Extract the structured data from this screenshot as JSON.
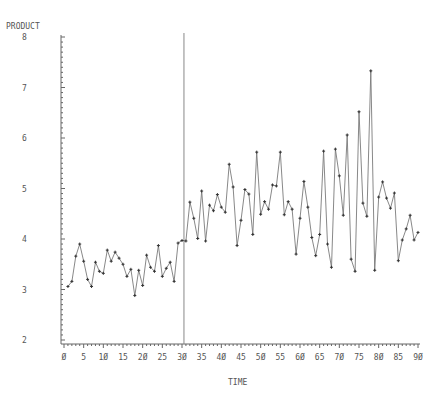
{
  "chart_data": {
    "type": "line",
    "title": "",
    "ylabel": "PRODUCT",
    "xlabel": "TIME",
    "xlim": [
      0,
      90
    ],
    "ylim": [
      2,
      8
    ],
    "x_ticks": [
      0,
      5,
      10,
      15,
      20,
      25,
      30,
      35,
      40,
      45,
      50,
      55,
      60,
      65,
      70,
      75,
      80,
      85,
      90
    ],
    "x_tick_labels": [
      "Ø",
      "5",
      "1Ø",
      "15",
      "2Ø",
      "25",
      "3Ø",
      "35",
      "4Ø",
      "45",
      "5Ø",
      "55",
      "6Ø",
      "65",
      "7Ø",
      "75",
      "8Ø",
      "85",
      "9Ø"
    ],
    "y_ticks": [
      2,
      3,
      4,
      5,
      6,
      7,
      8
    ],
    "y_tick_labels": [
      "2",
      "3",
      "4",
      "5",
      "6",
      "7",
      "8"
    ],
    "grid": false,
    "reference_line": {
      "x": 30.5,
      "orientation": "vertical"
    },
    "series": [
      {
        "name": "PRODUCT",
        "x": [
          1,
          2,
          3,
          4,
          5,
          6,
          7,
          8,
          9,
          10,
          11,
          12,
          13,
          14,
          15,
          16,
          17,
          18,
          19,
          20,
          21,
          22,
          23,
          24,
          25,
          26,
          27,
          28,
          29,
          30,
          31,
          32,
          33,
          34,
          35,
          36,
          37,
          38,
          39,
          40,
          41,
          42,
          43,
          44,
          45,
          46,
          47,
          48,
          49,
          50,
          51,
          52,
          53,
          54,
          55,
          56,
          57,
          58,
          59,
          60,
          61,
          62,
          63,
          64,
          65,
          66,
          67,
          68,
          69,
          70,
          71,
          72,
          73,
          74,
          75,
          76,
          77,
          78,
          79,
          80,
          81,
          82,
          83,
          84,
          85,
          86,
          87,
          88,
          89,
          90
        ],
        "values": [
          3.06,
          3.16,
          3.66,
          3.9,
          3.56,
          3.2,
          3.06,
          3.54,
          3.36,
          3.32,
          3.78,
          3.56,
          3.74,
          3.62,
          3.5,
          3.26,
          3.4,
          2.88,
          3.38,
          3.08,
          3.68,
          3.44,
          3.36,
          3.87,
          3.26,
          3.42,
          3.54,
          3.16,
          3.92,
          3.97,
          3.96,
          4.73,
          4.41,
          4.01,
          4.95,
          3.96,
          4.67,
          4.56,
          4.88,
          4.63,
          4.53,
          5.48,
          5.03,
          3.87,
          4.37,
          4.98,
          4.89,
          4.09,
          5.72,
          4.49,
          4.74,
          4.59,
          5.07,
          5.05,
          5.72,
          4.48,
          4.74,
          4.59,
          3.7,
          4.41,
          5.14,
          4.63,
          4.03,
          3.67,
          4.09,
          5.74,
          3.9,
          3.44,
          5.78,
          5.25,
          4.47,
          6.06,
          3.6,
          3.36,
          6.52,
          4.71,
          4.45,
          7.33,
          3.38,
          4.83,
          5.13,
          4.81,
          4.61,
          4.91,
          3.57,
          3.98,
          4.2,
          4.47,
          3.98,
          4.13
        ]
      }
    ]
  },
  "labels": {
    "y_axis_title": "PRODUCT",
    "x_axis_title": "TIME"
  },
  "colors": {
    "line": "#7a7a7a",
    "axis": "#666666",
    "text": "#555555"
  }
}
